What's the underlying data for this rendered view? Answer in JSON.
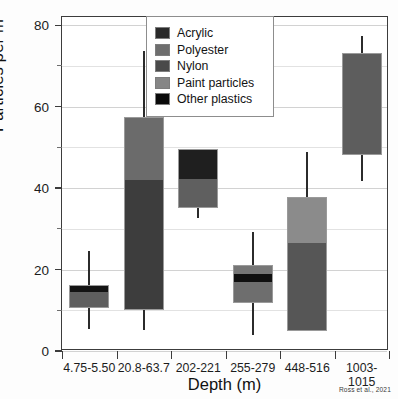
{
  "chart_data": {
    "type": "bar",
    "title": "",
    "subtitle": "",
    "xlabel": "Depth (m)",
    "ylabel": "Particles per m³",
    "ylim": [
      0,
      82
    ],
    "yticks": [
      0,
      20,
      40,
      60,
      80
    ],
    "yticks_minor": [
      10,
      30,
      50,
      70
    ],
    "grid": true,
    "legend_position": "top-center",
    "attribution": "Ross et al., 2021",
    "categories": [
      "4.75-5.50",
      "20.8-63.7",
      "202-221",
      "255-279",
      "448-516",
      "1003-1015"
    ],
    "legend_entries": [
      {
        "label": "Acrylic",
        "color": "#2a2a2a"
      },
      {
        "label": "Polyester",
        "color": "#6e6e6e"
      },
      {
        "label": "Nylon",
        "color": "#4a4a4a"
      },
      {
        "label": "Paint particles",
        "color": "#868686"
      },
      {
        "label": "Other plastics",
        "color": "#0a0a0a"
      }
    ],
    "bars": [
      {
        "category": "4.75-5.50",
        "box_bottom": 10.6,
        "box_top": 16.2,
        "whisker_low": 5.4,
        "whisker_high": 24.6,
        "segments": [
          {
            "series": "Polyester",
            "from": 10.6,
            "to": 14.4,
            "color": "#5f5f5f"
          },
          {
            "series": "Other plastics",
            "from": 14.4,
            "to": 16.2,
            "color": "#141414"
          }
        ]
      },
      {
        "category": "20.8-63.7",
        "box_bottom": 10.0,
        "box_top": 57.4,
        "whisker_low": 5.2,
        "whisker_high": 73.6,
        "segments": [
          {
            "series": "Nylon",
            "from": 10.0,
            "to": 42.0,
            "color": "#3d3d3d"
          },
          {
            "series": "Polyester",
            "from": 42.0,
            "to": 57.4,
            "color": "#6b6b6b"
          }
        ]
      },
      {
        "category": "202-221",
        "box_bottom": 35.0,
        "box_top": 49.6,
        "whisker_low": 32.6,
        "whisker_high": 49.6,
        "segments": [
          {
            "series": "Polyester",
            "from": 35.0,
            "to": 42.2,
            "color": "#5f5f5f"
          },
          {
            "series": "Acrylic",
            "from": 42.2,
            "to": 49.6,
            "color": "#1f1f1f"
          }
        ]
      },
      {
        "category": "255-279",
        "box_bottom": 11.8,
        "box_top": 21.0,
        "whisker_low": 4.0,
        "whisker_high": 29.2,
        "segments": [
          {
            "series": "Paint particles",
            "from": 11.8,
            "to": 16.9,
            "color": "#6e6e6e"
          },
          {
            "series": "Other plastics",
            "from": 16.9,
            "to": 18.8,
            "color": "#101010"
          },
          {
            "series": "Polyester",
            "from": 18.8,
            "to": 21.0,
            "color": "#767676"
          }
        ]
      },
      {
        "category": "448-516",
        "box_bottom": 4.8,
        "box_top": 37.8,
        "whisker_low": 4.8,
        "whisker_high": 48.8,
        "segments": [
          {
            "series": "Nylon",
            "from": 4.8,
            "to": 26.4,
            "color": "#565656"
          },
          {
            "series": "Paint particles",
            "from": 26.4,
            "to": 37.8,
            "color": "#8b8b8b"
          }
        ]
      },
      {
        "category": "1003-1015",
        "box_bottom": 48.0,
        "box_top": 73.2,
        "whisker_low": 41.8,
        "whisker_high": 77.4,
        "segments": [
          {
            "series": "Polyester",
            "from": 48.0,
            "to": 73.2,
            "color": "#5d5d5d"
          }
        ]
      }
    ]
  }
}
